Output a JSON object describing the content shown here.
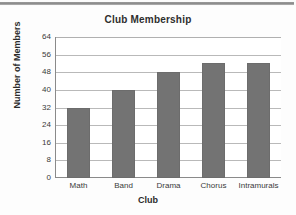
{
  "chart_data": {
    "type": "bar",
    "title": "Club Membership",
    "xlabel": "Club",
    "ylabel": "Number of Members",
    "categories": [
      "Math",
      "Band",
      "Drama",
      "Chorus",
      "Intramurals"
    ],
    "values": [
      32,
      40,
      48,
      52,
      52
    ],
    "ylim": [
      0,
      64
    ],
    "yticks": [
      0,
      8,
      16,
      24,
      32,
      40,
      48,
      56,
      64
    ],
    "grid": true,
    "legend": null,
    "bar_color": "#737373",
    "plot_background": "#ffffff",
    "axis_color": "#8a8a8a",
    "gridline_color": "#b9b9b9"
  }
}
